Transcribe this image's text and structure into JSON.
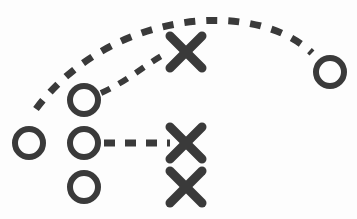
{
  "diagram": {
    "title": "Play Diagram",
    "background_color": "#fdfdfd",
    "stroke_color": "#3a3a3a",
    "width": 357,
    "height": 219
  },
  "chart_data": {
    "type": "scatter",
    "title": "Play Diagram",
    "xlabel": "",
    "ylabel": "",
    "xlim": [
      0,
      357
    ],
    "ylim": [
      0,
      219
    ],
    "grid": false,
    "legend": "none",
    "series": [
      {
        "name": "Offense (circle)",
        "marker": "circle-outline",
        "color": "#3a3a3a",
        "radius": 14,
        "stroke_width": 6,
        "points": [
          {
            "label": "O1",
            "x": 29,
            "y": 143
          },
          {
            "label": "O2",
            "x": 84,
            "y": 100
          },
          {
            "label": "O3",
            "x": 84,
            "y": 143
          },
          {
            "label": "O4",
            "x": 84,
            "y": 187
          },
          {
            "label": "O5",
            "x": 330,
            "y": 72
          }
        ]
      },
      {
        "name": "Defense (cross)",
        "marker": "x-cross",
        "color": "#3a3a3a",
        "half_size": 16,
        "stroke_width": 9,
        "points": [
          {
            "label": "X1",
            "x": 186,
            "y": 52
          },
          {
            "label": "X2",
            "x": 186,
            "y": 143
          },
          {
            "label": "X3",
            "x": 186,
            "y": 187
          }
        ]
      }
    ],
    "paths": [
      {
        "label": "long-arc-route",
        "style": "dashed",
        "dash": "11 11",
        "stroke_width": 7,
        "color": "#3a3a3a",
        "from": {
          "x": 36,
          "y": 109
        },
        "to": {
          "x": 312,
          "y": 53
        },
        "control_points": [
          {
            "x": 110,
            "y": 10
          },
          {
            "x": 255,
            "y": -2
          }
        ]
      },
      {
        "label": "short-arc-route",
        "style": "dashed",
        "dash": "10 10",
        "stroke_width": 6,
        "color": "#3a3a3a",
        "from": {
          "x": 101,
          "y": 93
        },
        "to": {
          "x": 169,
          "y": 52
        },
        "control_points": [
          {
            "x": 130,
            "y": 80
          },
          {
            "x": 148,
            "y": 62
          }
        ]
      },
      {
        "label": "straight-route",
        "style": "dashed",
        "dash": "11 10",
        "stroke_width": 7,
        "color": "#3a3a3a",
        "from": {
          "x": 104,
          "y": 143
        },
        "to": {
          "x": 170,
          "y": 143
        },
        "control_points": []
      }
    ]
  },
  "labels": {
    "offense_marker": "Offensive player position",
    "defense_marker": "Defensive player position",
    "route_path": "Movement route"
  }
}
